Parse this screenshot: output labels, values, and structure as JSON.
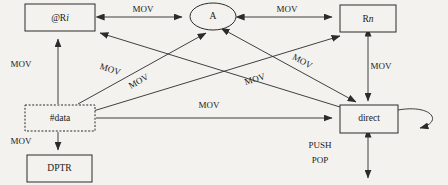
{
  "diagram": {
    "canvas": {
      "width": 448,
      "height": 185
    },
    "colors": {
      "background": "#f4f2ee",
      "stroke": "#2b2b2b",
      "node_fill": "#f4f2ee",
      "text": "#1a1a1a"
    },
    "nodes": [
      {
        "id": "at_ri",
        "label": "@R",
        "label_italic_suffix": "i",
        "shape": "rect",
        "x": 25,
        "y": 4,
        "w": 70,
        "h": 27
      },
      {
        "id": "a",
        "label": "A",
        "shape": "ellipse",
        "x": 190,
        "y": 3,
        "w": 46,
        "h": 27
      },
      {
        "id": "rn",
        "label": "R",
        "label_italic_suffix": "n",
        "shape": "rect",
        "x": 340,
        "y": 5,
        "w": 56,
        "h": 27
      },
      {
        "id": "hdata",
        "label": "#data",
        "shape": "rect-dashed",
        "x": 25,
        "y": 105,
        "w": 70,
        "h": 26
      },
      {
        "id": "dptr",
        "label": "DPTR",
        "shape": "rect",
        "x": 27,
        "y": 155,
        "w": 65,
        "h": 27
      },
      {
        "id": "direct",
        "label": "direct",
        "shape": "rect",
        "x": 340,
        "y": 105,
        "w": 58,
        "h": 28
      }
    ],
    "edges": [
      {
        "id": "e-ri-a",
        "from": "at_ri",
        "to": "a",
        "label": "MOV",
        "direction": "both",
        "label_x": 143,
        "label_y": 10,
        "label_rotate": 0
      },
      {
        "id": "e-a-rn",
        "from": "a",
        "to": "rn",
        "label": "MOV",
        "direction": "both",
        "label_x": 287,
        "label_y": 10,
        "label_rotate": 0
      },
      {
        "id": "e-hdata-ri",
        "from": "hdata",
        "to": "at_ri",
        "label": "MOV",
        "direction": "forward",
        "label_x": 13,
        "label_y": 65,
        "label_rotate": 0
      },
      {
        "id": "e-hdata-dptr",
        "from": "hdata",
        "to": "dptr",
        "label": "MOV",
        "direction": "forward",
        "label_x": 13,
        "label_y": 142,
        "label_rotate": 0
      },
      {
        "id": "e-hdata-direct",
        "from": "hdata",
        "to": "direct",
        "label": "MOV",
        "direction": "forward",
        "label_x": 209,
        "label_y": 105,
        "label_rotate": 0
      },
      {
        "id": "e-hdata-a",
        "from": "hdata",
        "to": "a",
        "label": "MOV",
        "direction": "forward",
        "label_x": 144,
        "label_y": 85,
        "label_rotate": -26
      },
      {
        "id": "e-hdata-rn",
        "from": "hdata",
        "to": "rn",
        "label": "MOV",
        "direction": "forward",
        "label_x": 257,
        "label_y": 84,
        "label_rotate": -22
      },
      {
        "id": "e-direct-ri",
        "from": "direct",
        "to": "at_ri",
        "label": "MOV",
        "direction": "forward",
        "label_x": 108,
        "label_y": 72,
        "label_rotate": 27
      },
      {
        "id": "e-a-direct",
        "from": "a",
        "to": "direct",
        "label": "MOV",
        "direction": "both",
        "label_x": 305,
        "label_y": 63,
        "label_rotate": 29
      },
      {
        "id": "e-rn-direct",
        "from": "rn",
        "to": "direct",
        "label": "MOV",
        "direction": "both",
        "label_x": 381,
        "label_y": 67,
        "label_rotate": 0
      },
      {
        "id": "e-direct-self",
        "from": "direct",
        "to": "direct",
        "label": "",
        "direction": "forward",
        "label_x": 0,
        "label_y": 0,
        "label_rotate": 0
      },
      {
        "id": "e-direct-stack",
        "from": "direct",
        "to": "stack",
        "label": "PUSH POP",
        "direction": "both",
        "label_x": 320,
        "label_y": 152,
        "label_rotate": 0
      }
    ],
    "edge_labels": {
      "mov": "MOV",
      "push": "PUSH",
      "pop": "POP"
    }
  }
}
